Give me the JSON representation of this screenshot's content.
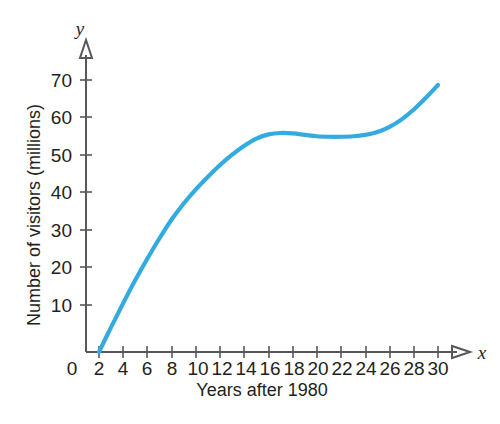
{
  "chart_data": {
    "type": "line",
    "title": "",
    "subtitle": "",
    "xlabel": "Years after 1980",
    "ylabel": "Number of visitors (millions)",
    "x_axis_variable": "x",
    "y_axis_variable": "y",
    "xlim": [
      0,
      31
    ],
    "ylim": [
      0,
      75
    ],
    "grid": false,
    "legend": null,
    "x_ticks": [
      2,
      4,
      6,
      8,
      10,
      12,
      14,
      16,
      18,
      20,
      22,
      24,
      26,
      28,
      30
    ],
    "x_tick_labels": [
      "2",
      "4",
      "6",
      "8",
      "10",
      "12",
      "14",
      "16",
      "18",
      "20",
      "22",
      "24",
      "26",
      "28",
      "30"
    ],
    "origin_label": "0",
    "y_ticks": [
      10,
      20,
      30,
      40,
      50,
      60,
      70
    ],
    "y_tick_labels": [
      "10",
      "20",
      "30",
      "40",
      "50",
      "60",
      "70"
    ],
    "series": [
      {
        "name": "Number of visitors",
        "color": "#33ABE0",
        "x": [
          2,
          3,
          4,
          5,
          6,
          7,
          8,
          9,
          10,
          11,
          12,
          13,
          14,
          15,
          16,
          17,
          18,
          19,
          20,
          21,
          22,
          23,
          24,
          25,
          26,
          27,
          28,
          29,
          30
        ],
        "y": [
          0,
          5.3,
          10.4,
          15.3,
          19.9,
          24.2,
          28.2,
          31.6,
          34.6,
          37.3,
          39.8,
          42.0,
          43.9,
          45.4,
          46.3,
          46.6,
          46.5,
          46.2,
          45.9,
          45.8,
          45.8,
          45.9,
          46.2,
          46.8,
          47.9,
          49.5,
          51.6,
          54.1,
          56.8
        ]
      }
    ]
  },
  "figure": {
    "background_color": "#ffffff",
    "axis_color": "#58585b",
    "text_color": "#231f20",
    "curve_color": "#33ABE0"
  }
}
